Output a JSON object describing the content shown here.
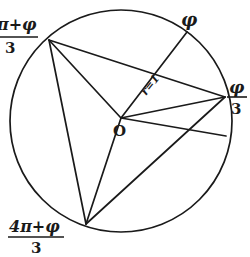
{
  "diagram": {
    "type": "circle-angle-trisection",
    "center_label": "O",
    "radius_label": "r=1",
    "labels": {
      "phi": "φ",
      "phi_over_3": {
        "numerator": "φ",
        "denominator": "3"
      },
      "two_pi_plus_phi_over_3": {
        "numerator": "2π+φ",
        "denominator": "3",
        "visible_numerator": "π+φ"
      },
      "four_pi_plus_phi_over_3": {
        "numerator": "4π+φ",
        "denominator": "3"
      }
    },
    "points": {
      "O": [
        121,
        118
      ],
      "P_phi": [
        187,
        32
      ],
      "A_phi_3": [
        225,
        97
      ],
      "B_2pi_phi_3": [
        49,
        40
      ],
      "C_4pi_phi_3": [
        86,
        224
      ],
      "D_circle": [
        226,
        136
      ]
    },
    "circle": {
      "cx": 121,
      "cy": 121,
      "r": 111
    },
    "colors": {
      "ink": "#1a1a1a",
      "background": "#ffffff"
    }
  }
}
